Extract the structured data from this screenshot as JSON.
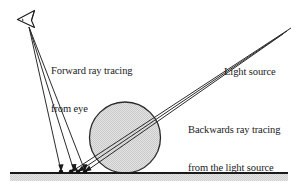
{
  "figure": {
    "background_color": "#ffffff",
    "line_color": "#1a1a1a",
    "sphere_fill_color": "#d7d7d7",
    "ground_band_color": "#d9d9d9"
  },
  "labels": {
    "forward": {
      "line1": "Forward ray tracing",
      "line2": "from eye"
    },
    "light_source": {
      "line1": "Light source"
    },
    "backwards": {
      "line1": "Backwards ray tracing",
      "line2": "from the light source"
    }
  },
  "icons": {
    "eye": "eye-icon"
  },
  "diagram_data": {
    "type": "diagram",
    "ground": {
      "y": 173,
      "x_start": 10,
      "x_end": 288,
      "thickness": 2.2,
      "band_height": 7
    },
    "sphere": {
      "cx": 125,
      "cy": 137.5,
      "r": 35.5
    },
    "eye": {
      "x": 26,
      "y": 19
    },
    "forward_rays": [
      {
        "from": [
          29,
          27
        ],
        "to": [
          61,
          171
        ]
      },
      {
        "from": [
          29,
          27
        ],
        "to": [
          74,
          171
        ]
      },
      {
        "from": [
          29,
          27
        ],
        "to": [
          85,
          171
        ]
      }
    ],
    "backward_rays": [
      {
        "from": [
          291,
          28
        ],
        "to": [
          71,
          172
        ]
      },
      {
        "from": [
          287,
          31
        ],
        "to": [
          78,
          172
        ]
      },
      {
        "from": [
          283,
          34
        ],
        "to": [
          85,
          172
        ]
      }
    ],
    "hit_points": [
      {
        "x": 61,
        "y": 172
      },
      {
        "x": 71,
        "y": 172
      },
      {
        "x": 78,
        "y": 172
      },
      {
        "x": 85,
        "y": 172
      }
    ]
  }
}
